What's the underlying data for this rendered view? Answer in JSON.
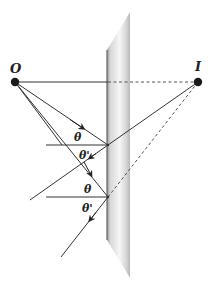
{
  "diagram": {
    "type": "plane-mirror-reflection",
    "object_label": "O",
    "image_label": "I",
    "angle_incidence_label": "θ",
    "angle_reflection_label": "θ'",
    "colors": {
      "line": "#333333",
      "dashed": "#555555",
      "point": "#1a1a1a",
      "mirror_light": "#f4f4f4",
      "mirror_dark": "#a8a8a8"
    },
    "points": {
      "object": {
        "x": 15,
        "y": 82
      },
      "image": {
        "x": 198,
        "y": 82
      },
      "reflection_1": {
        "x": 108,
        "y": 145
      },
      "reflection_2": {
        "x": 108,
        "y": 197
      }
    },
    "rays": [
      {
        "from": "object",
        "to": "reflection_1",
        "type": "incident"
      },
      {
        "from": "object",
        "to": "reflection_2",
        "type": "incident"
      },
      {
        "from": "reflection_1",
        "direction": "lower-left",
        "type": "reflected"
      },
      {
        "from": "reflection_2",
        "direction": "lower-left",
        "type": "reflected"
      }
    ],
    "angle_labels": [
      {
        "text": "θ",
        "at": "reflection_1",
        "side": "above-normal"
      },
      {
        "text": "θ'",
        "at": "reflection_1",
        "side": "below-normal"
      },
      {
        "text": "θ",
        "at": "reflection_2",
        "side": "above-normal"
      },
      {
        "text": "θ'",
        "at": "reflection_2",
        "side": "below-normal"
      }
    ]
  }
}
